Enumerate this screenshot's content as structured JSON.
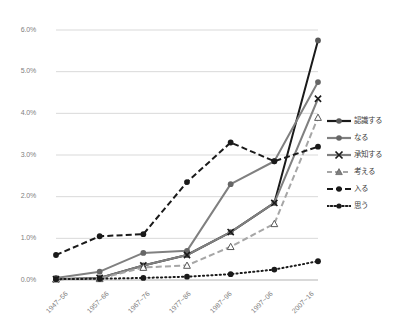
{
  "chart_data": {
    "type": "line",
    "title": "",
    "xlabel": "",
    "ylabel": "",
    "ylim": [
      0,
      6
    ],
    "ytick_labels": [
      "0.0%",
      "1.0%",
      "2.0%",
      "3.0%",
      "4.0%",
      "5.0%",
      "6.0%"
    ],
    "ytick_values": [
      0,
      1,
      2,
      3,
      4,
      5,
      6
    ],
    "grid": true,
    "legend_position": "right",
    "categories": [
      "1947~56",
      "1957~66",
      "1967~76",
      "1977~86",
      "1987~96",
      "1997~06",
      "2007~16"
    ],
    "series": [
      {
        "name": "認識する",
        "color": "#1a1a1a",
        "dash": "none",
        "marker": "circle",
        "values": [
          0.02,
          0.05,
          0.35,
          0.6,
          1.15,
          1.85,
          5.75
        ]
      },
      {
        "name": "なる",
        "color": "#808080",
        "dash": "none",
        "marker": "circle",
        "values": [
          0.05,
          0.2,
          0.65,
          0.7,
          2.3,
          2.85,
          4.75
        ]
      },
      {
        "name": "承知する",
        "color": "#808080",
        "dash": "none",
        "marker": "x",
        "values": [
          0.02,
          0.05,
          0.35,
          0.6,
          1.15,
          1.85,
          4.35
        ]
      },
      {
        "name": "考える",
        "color": "#a6a6a6",
        "dash": "dashed",
        "marker": "triangle",
        "values": [
          0.02,
          0.03,
          0.3,
          0.35,
          0.8,
          1.35,
          3.9
        ]
      },
      {
        "name": "入る",
        "color": "#1a1a1a",
        "dash": "dashed",
        "marker": "circle",
        "values": [
          0.6,
          1.05,
          1.1,
          2.35,
          3.3,
          2.85,
          3.2
        ]
      },
      {
        "name": "思う",
        "color": "#1a1a1a",
        "dash": "dotted",
        "marker": "circle",
        "values": [
          0.02,
          0.03,
          0.05,
          0.08,
          0.14,
          0.25,
          0.45
        ]
      }
    ]
  },
  "axes": {
    "y_labels": [
      "6.0%",
      "5.0%",
      "4.0%",
      "3.0%",
      "2.0%",
      "1.0%",
      "0.0%"
    ],
    "x_labels": [
      "1947~56",
      "1957~66",
      "1967~76",
      "1977~86",
      "1987~96",
      "1997~06",
      "2007~16"
    ]
  },
  "legend": {
    "items": [
      {
        "label": "認識する"
      },
      {
        "label": "なる"
      },
      {
        "label": "承知する"
      },
      {
        "label": "考える"
      },
      {
        "label": "入る"
      },
      {
        "label": "思う"
      }
    ]
  },
  "colors": {
    "black": "#1a1a1a",
    "gray": "#808080",
    "light_gray": "#a6a6a6",
    "grid": "#d9d9d9",
    "tick_text": "#808080"
  }
}
